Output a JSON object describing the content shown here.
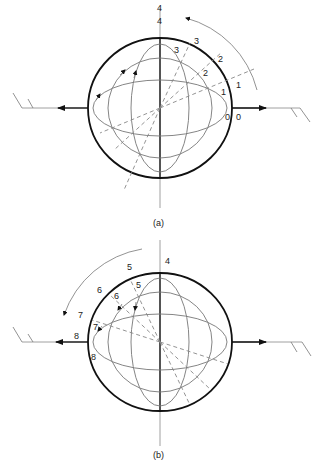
{
  "figure": {
    "panels": [
      {
        "id": "a",
        "caption": "(a)",
        "center": [
          160,
          108
        ],
        "outer_radius": [
          72,
          70
        ],
        "rotation_direction": "counter-clockwise",
        "labels_outer": [
          "0",
          "1",
          "2",
          "3",
          "4"
        ],
        "labels_inner": [
          "0",
          "1",
          "2",
          "3",
          "4"
        ]
      },
      {
        "id": "b",
        "caption": "(b)",
        "center": [
          160,
          341
        ],
        "outer_radius": [
          72,
          69
        ],
        "rotation_direction": "counter-clockwise",
        "labels_outer": [
          "4",
          "5",
          "6",
          "7",
          "8"
        ],
        "labels_inner": [
          "5",
          "6",
          "7",
          "8"
        ]
      }
    ]
  },
  "labels": {
    "a": {
      "o0": "0",
      "i0": "0",
      "o1": "1",
      "i1": "1",
      "o2": "2",
      "i2": "2",
      "o3": "3",
      "i3": "3",
      "o4": "4",
      "i4": "4",
      "caption": "(a)"
    },
    "b": {
      "o4": "4",
      "o5": "5",
      "i5": "5",
      "o6": "6",
      "i6": "6",
      "o7": "7",
      "i7": "7",
      "o8": "8",
      "i8": "8",
      "caption": "(b)"
    }
  },
  "colors": {
    "outer_circle": "#111111",
    "ellipses": "#777777",
    "dashed": "#888888"
  }
}
